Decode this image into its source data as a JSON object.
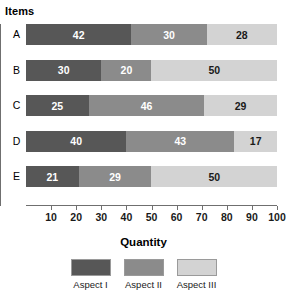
{
  "chart_data": {
    "type": "bar",
    "orientation": "horizontal",
    "stacked": true,
    "title": "",
    "xlabel": "Quantity",
    "ylabel": "Items",
    "categories": [
      "A",
      "B",
      "C",
      "D",
      "E"
    ],
    "series": [
      {
        "name": "Aspect I",
        "color": "#575757",
        "values": [
          42,
          30,
          25,
          40,
          21
        ]
      },
      {
        "name": "Aspect II",
        "color": "#8b8b8b",
        "values": [
          30,
          20,
          46,
          43,
          29
        ]
      },
      {
        "name": "Aspect III",
        "color": "#d3d3d3",
        "values": [
          28,
          50,
          29,
          17,
          50
        ]
      }
    ],
    "xlim": [
      0,
      100
    ],
    "xticks": [
      10,
      20,
      30,
      40,
      50,
      60,
      70,
      80,
      90,
      100
    ],
    "grid": false,
    "legend_position": "bottom"
  },
  "axes": {
    "y_title": "Items",
    "x_title": "Quantity"
  },
  "legend": {
    "items": [
      {
        "label": "Aspect I",
        "color": "#575757"
      },
      {
        "label": "Aspect II",
        "color": "#8b8b8b"
      },
      {
        "label": "Aspect III",
        "color": "#d3d3d3"
      }
    ]
  },
  "rows": [
    {
      "category": "A",
      "segments": [
        {
          "value": "42"
        },
        {
          "value": "30"
        },
        {
          "value": "28"
        }
      ]
    },
    {
      "category": "B",
      "segments": [
        {
          "value": "30"
        },
        {
          "value": "20"
        },
        {
          "value": "50"
        }
      ]
    },
    {
      "category": "C",
      "segments": [
        {
          "value": "25"
        },
        {
          "value": "46"
        },
        {
          "value": "29"
        }
      ]
    },
    {
      "category": "D",
      "segments": [
        {
          "value": "40"
        },
        {
          "value": "43"
        },
        {
          "value": "17"
        }
      ]
    },
    {
      "category": "E",
      "segments": [
        {
          "value": "21"
        },
        {
          "value": "29"
        },
        {
          "value": "50"
        }
      ]
    }
  ],
  "ticks": [
    "10",
    "20",
    "30",
    "40",
    "50",
    "60",
    "70",
    "80",
    "90",
    "100"
  ]
}
